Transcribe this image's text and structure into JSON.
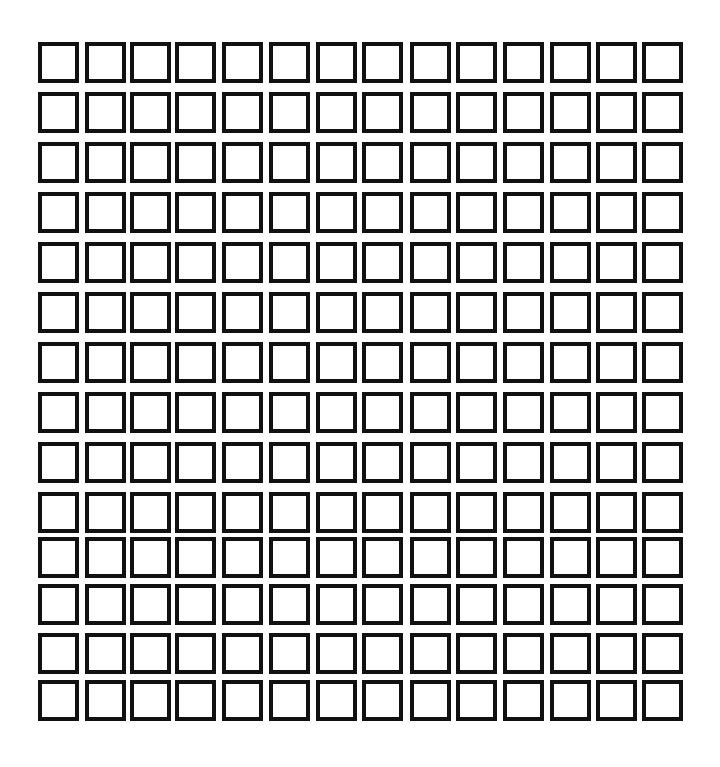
{
  "grid": {
    "rows": 14,
    "cols": 14,
    "border_color": "#111111",
    "fill_color": "#ffffff",
    "col_offsets": [
      0,
      47,
      92,
      137,
      184,
      231,
      278,
      324,
      372,
      418,
      465,
      512,
      558,
      604
    ],
    "row_offsets": [
      0,
      50,
      100,
      150,
      200,
      250,
      300,
      350,
      400,
      450,
      495,
      542,
      591,
      638
    ],
    "checked": []
  }
}
